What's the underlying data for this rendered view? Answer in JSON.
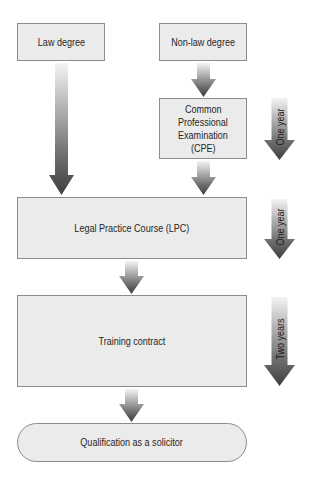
{
  "diagram": {
    "type": "flowchart",
    "title": "",
    "nodes": [
      {
        "id": "law_degree",
        "label": "Law degree",
        "shape": "rectangle"
      },
      {
        "id": "non_law_degree",
        "label": "Non-law degree",
        "shape": "rectangle"
      },
      {
        "id": "cpe",
        "label": "Common Professional Examination (CPE)",
        "lines": [
          "Common",
          "Professional",
          "Examination",
          "(CPE)"
        ],
        "shape": "rectangle"
      },
      {
        "id": "lpc",
        "label": "Legal Practice Course (LPC)",
        "shape": "rectangle"
      },
      {
        "id": "training",
        "label": "Training contract",
        "shape": "rectangle"
      },
      {
        "id": "qualification",
        "label": "Qualification as a solicitor",
        "shape": "rounded"
      }
    ],
    "edges": [
      {
        "from": "law_degree",
        "to": "lpc"
      },
      {
        "from": "non_law_degree",
        "to": "cpe"
      },
      {
        "from": "cpe",
        "to": "lpc"
      },
      {
        "from": "lpc",
        "to": "training"
      },
      {
        "from": "training",
        "to": "qualification"
      }
    ],
    "durations": [
      {
        "applies_to": "cpe",
        "label": "One year"
      },
      {
        "applies_to": "lpc",
        "label": "One year"
      },
      {
        "applies_to": "training",
        "label": "Two years"
      }
    ]
  },
  "colors": {
    "box_fill": "#ebebeb",
    "box_border": "#8c8c8c",
    "arrow_top": "#f2f2f2",
    "arrow_bottom": "#4a4a4a",
    "text": "#262626"
  }
}
